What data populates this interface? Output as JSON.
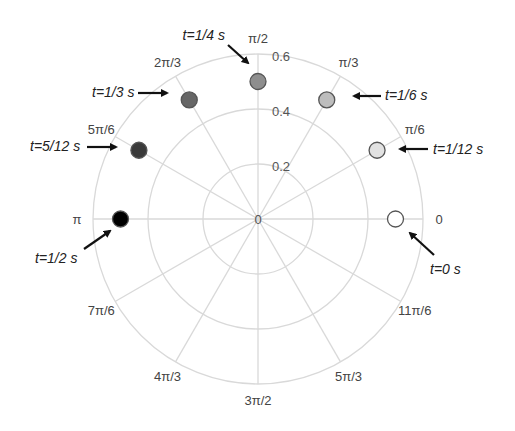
{
  "chart_data": {
    "type": "scatter",
    "subtype": "polar",
    "title": "",
    "center_px": [
      258,
      219
    ],
    "r_max": 0.6,
    "r_max_px": 165,
    "radial_ticks": [
      {
        "value": 0,
        "label": "0"
      },
      {
        "value": 0.2,
        "label": "0.2"
      },
      {
        "value": 0.4,
        "label": "0.4"
      },
      {
        "value": 0.6,
        "label": "0.6"
      }
    ],
    "angle_ticks": [
      {
        "deg": 0,
        "label": "0"
      },
      {
        "deg": 30,
        "label": "π/6"
      },
      {
        "deg": 60,
        "label": "π/3"
      },
      {
        "deg": 90,
        "label": "π/2"
      },
      {
        "deg": 120,
        "label": "2π/3"
      },
      {
        "deg": 150,
        "label": "5π/6"
      },
      {
        "deg": 180,
        "label": "π"
      },
      {
        "deg": 210,
        "label": "7π/6"
      },
      {
        "deg": 240,
        "label": "4π/3"
      },
      {
        "deg": 270,
        "label": "3π/2"
      },
      {
        "deg": 300,
        "label": "5π/3"
      },
      {
        "deg": 330,
        "label": "11π/6"
      }
    ],
    "grid": true,
    "points": [
      {
        "t": "0",
        "label": "t=0 s",
        "theta_deg": 0,
        "r": 0.5,
        "fill": "#ffffff"
      },
      {
        "t": "1/12",
        "label": "t=1/12 s",
        "theta_deg": 30,
        "r": 0.5,
        "fill": "#e2e2e2"
      },
      {
        "t": "1/6",
        "label": "t=1/6 s",
        "theta_deg": 60,
        "r": 0.5,
        "fill": "#bdbdbd"
      },
      {
        "t": "1/4",
        "label": "t=1/4 s",
        "theta_deg": 90,
        "r": 0.5,
        "fill": "#8e8e8e"
      },
      {
        "t": "1/3",
        "label": "t=1/3 s",
        "theta_deg": 120,
        "r": 0.5,
        "fill": "#666666"
      },
      {
        "t": "5/12",
        "label": "t=5/12 s",
        "theta_deg": 150,
        "r": 0.5,
        "fill": "#3a3a3a"
      },
      {
        "t": "1/2",
        "label": "t=1/2 s",
        "theta_deg": 180,
        "r": 0.5,
        "fill": "#000000"
      }
    ],
    "annotations": [
      {
        "text": "t=0 s",
        "x": 430,
        "y": 274,
        "anchor": "start",
        "arrow": [
          [
            434,
            255
          ],
          [
            410,
            233
          ]
        ]
      },
      {
        "text": "t=1/12 s",
        "x": 433,
        "y": 154,
        "anchor": "start",
        "arrow": [
          [
            428,
            149
          ],
          [
            400,
            149
          ]
        ]
      },
      {
        "text": "t=1/6 s",
        "x": 385,
        "y": 100,
        "anchor": "start",
        "arrow": [
          [
            381,
            96
          ],
          [
            354,
            96
          ]
        ]
      },
      {
        "text": "t=1/4 s",
        "x": 225,
        "y": 40,
        "anchor": "end",
        "arrow": [
          [
            228,
            45
          ],
          [
            248,
            63
          ]
        ]
      },
      {
        "text": "t=1/3 s",
        "x": 92,
        "y": 97,
        "anchor": "start",
        "arrow": [
          [
            138,
            93
          ],
          [
            167,
            93
          ]
        ]
      },
      {
        "text": "t=5/12 s",
        "x": 30,
        "y": 151,
        "anchor": "start",
        "arrow": [
          [
            87,
            147
          ],
          [
            116,
            147
          ]
        ]
      },
      {
        "text": "t=1/2 s",
        "x": 35,
        "y": 263,
        "anchor": "start",
        "arrow": [
          [
            84,
            249
          ],
          [
            110,
            231
          ]
        ]
      }
    ]
  }
}
